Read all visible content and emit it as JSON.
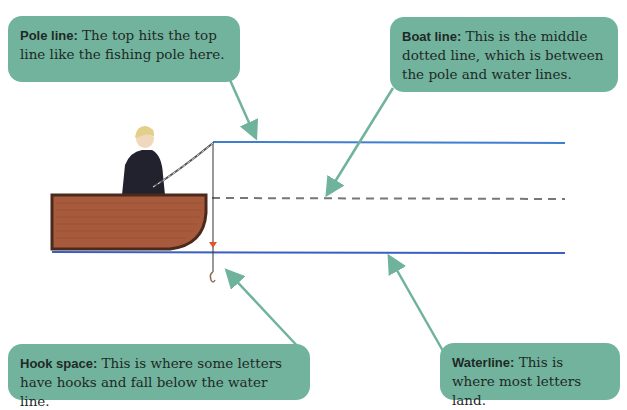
{
  "callouts": {
    "pole_line": {
      "term": "Pole line:",
      "text": " The top hits the top line like the fishing pole here."
    },
    "boat_line": {
      "term": "Boat line:",
      "text": " This is the middle dotted line, which is between the pole and water lines."
    },
    "hook_space": {
      "term": "Hook space:",
      "text": " This is where some letters have hooks and fall below the water line."
    },
    "waterline": {
      "term": "Waterline:",
      "text": " This is where most letters land."
    }
  },
  "colors": {
    "callout_bg": "#72b39d",
    "arrow": "#6fb39c",
    "pole_line": "#3f7fd0",
    "water_line": "#3b5fc0",
    "boat_line": "#777777",
    "boat_wood": "#a85a3c",
    "boat_rim": "#4a2a1c"
  }
}
